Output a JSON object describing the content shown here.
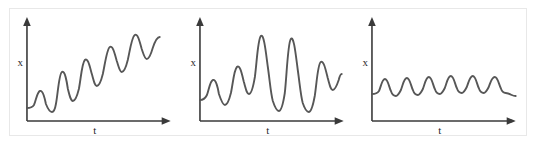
{
  "figure": {
    "panel_count": 3,
    "background_color": "#ffffff",
    "frame_color": "#e8e8e8",
    "curve_color": "#575757",
    "axis_color": "#3a3a3a"
  },
  "chart_data": [
    {
      "type": "line",
      "title": "",
      "xlabel": "t",
      "ylabel": "x",
      "description": "Oscillation with growing amplitude and rising mean level",
      "grid": false,
      "legend": null,
      "xlim": [
        0,
        100
      ],
      "ylim": [
        0,
        100
      ],
      "axis_arrows": true,
      "x": [
        0,
        3,
        6,
        9,
        12,
        15,
        18,
        21,
        24,
        27,
        30,
        33,
        36,
        39,
        42,
        45,
        48,
        51,
        54,
        57,
        60,
        63,
        66,
        69,
        72,
        75,
        78,
        81,
        84,
        87,
        90,
        93,
        96
      ],
      "y": [
        20,
        20,
        23,
        29,
        31,
        27,
        21,
        19,
        21,
        27,
        36,
        45,
        48,
        43,
        33,
        28,
        29,
        36,
        46,
        55,
        58,
        54,
        46,
        41,
        43,
        51,
        60,
        66,
        65,
        58,
        53,
        56,
        64
      ]
    },
    {
      "type": "line",
      "title": "",
      "xlabel": "t",
      "ylabel": "x",
      "description": "Oscillation that swells to large amplitude then decays",
      "grid": false,
      "legend": null,
      "xlim": [
        0,
        100
      ],
      "ylim": [
        0,
        100
      ],
      "axis_arrows": true,
      "x": [
        0,
        3,
        6,
        9,
        12,
        15,
        18,
        21,
        24,
        27,
        30,
        33,
        36,
        39,
        42,
        45,
        48,
        51,
        54,
        57,
        60,
        63,
        66,
        69,
        72,
        75,
        78,
        81,
        84,
        87,
        90,
        93,
        96
      ],
      "y": [
        26,
        29,
        33,
        31,
        24,
        20,
        24,
        33,
        41,
        44,
        40,
        31,
        24,
        30,
        47,
        66,
        74,
        66,
        44,
        22,
        10,
        14,
        30,
        52,
        70,
        78,
        72,
        50,
        24,
        8,
        14,
        30,
        38
      ]
    },
    {
      "type": "line",
      "title": "",
      "xlabel": "t",
      "ylabel": "x",
      "description": "Small regular oscillations of nearly constant amplitude, denser in the middle",
      "grid": false,
      "legend": null,
      "xlim": [
        0,
        100
      ],
      "ylim": [
        0,
        100
      ],
      "axis_arrows": true,
      "x": [
        0,
        3,
        6,
        9,
        12,
        15,
        18,
        21,
        24,
        27,
        30,
        33,
        36,
        39,
        42,
        45,
        48,
        51,
        54,
        57,
        60,
        63,
        66,
        69,
        72,
        75,
        78,
        81,
        84,
        87,
        90,
        93,
        96
      ],
      "y": [
        24,
        25,
        30,
        36,
        33,
        26,
        24,
        30,
        37,
        34,
        26,
        24,
        31,
        38,
        33,
        25,
        24,
        31,
        38,
        33,
        25,
        24,
        31,
        38,
        33,
        25,
        24,
        30,
        36,
        32,
        26,
        25,
        26
      ]
    }
  ],
  "panels": [
    {
      "name": "panel-growing-amplitude",
      "ylabel": "x",
      "xlabel": "t",
      "curve_path": "M 18,100 C 21,100 23,100 25,97 C 27,93 28,84 31,83 C 34,82 36,91 37,96 C 39,101 41,104 43,104 C 45,104 46,102 47,96 C 49,86 50,66 53,64 C 56,62 58,74 59,81 C 61,89 62,93 64,93 C 66,93 68,89 70,81 C 72,71 73,55 76,52 C 79,49 81,59 83,66 C 85,73 86,78 88,78 C 90,78 92,74 94,66 C 96,57 98,41 101,39 C 104,37 106,46 108,53 C 110,59 111,64 113,64 C 115,64 117,60 119,52 C 121,43 123,29 126,27 C 129,25 131,34 133,41 C 135,47 136,51 138,51 C 140,51 142,47 144,40 C 146,34 148,29 151,29"
    },
    {
      "name": "panel-swell-and-decay",
      "ylabel": "x",
      "xlabel": "t",
      "curve_path": "M 18,92 C 21,92 23,91 25,87 C 27,82 28,73 31,72 C 34,71 36,80 37,86 C 39,92 41,97 43,97 C 45,97 47,93 49,85 C 51,76 52,62 55,59 C 58,56 60,66 62,74 C 64,81 65,86 67,86 C 69,86 71,81 73,69 C 75,54 76,31 79,28 C 82,25 84,44 86,59 C 88,73 89,86 91,93 C 93,99 95,103 97,103 C 99,103 101,98 103,85 C 105,67 106,35 109,31 C 112,27 114,47 116,62 C 118,76 119,88 121,95 C 123,101 125,104 127,104 C 129,104 131,99 133,88 C 135,75 136,56 139,54 C 142,52 144,62 146,70 C 148,77 149,82 151,82 C 153,82 155,78 157,72 C 158,68 159,66 160,66"
    },
    {
      "name": "panel-uniform-small",
      "ylabel": "x",
      "xlabel": "t",
      "curve_path": "M 18,86 C 21,86 23,86 25,83 C 27,79 28,71 31,71 C 34,71 35,79 37,83 C 38,86 40,88 42,88 C 44,88 45,86 47,82 C 49,77 50,70 53,70 C 56,70 57,78 59,82 C 60,85 62,87 64,87 C 66,87 67,85 69,81 C 71,76 72,69 75,69 C 78,69 79,77 81,81 C 82,84 84,86 86,86 C 88,86 89,84 91,80 C 93,75 94,68 97,68 C 100,68 101,76 103,80 C 104,83 106,85 108,85 C 110,85 111,83 113,79 C 115,74 116,68 119,68 C 122,68 123,76 125,80 C 126,83 128,85 130,85 C 132,85 133,83 135,79 C 137,74 138,69 141,69 C 144,69 145,76 147,80 C 148,83 150,85 152,85 C 154,85 156,86 158,87 C 160,88 161,88 162,88"
    }
  ]
}
